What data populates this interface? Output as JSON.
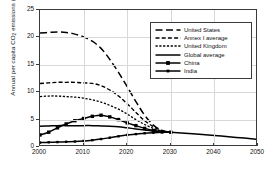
{
  "chart_data": {
    "type": "line",
    "title": "",
    "xlabel": "",
    "ylabel": "Annual per capita CO2 emissions (tCO2)",
    "ylabel_main": "Annual per capita CO",
    "ylabel_sub1": "2",
    "ylabel_mid": " emissions (tCO",
    "ylabel_sub2": "2",
    "ylabel_end": ")",
    "xlim": [
      2000,
      2050
    ],
    "ylim": [
      0,
      25
    ],
    "xticks": [
      "2000",
      "2010",
      "2020",
      "2030",
      "2040",
      "2050"
    ],
    "yticks": [
      "0",
      "5",
      "10",
      "15",
      "20",
      "25"
    ],
    "grid": true,
    "legend_position": "upper right",
    "x": [
      2000,
      2002,
      2004,
      2006,
      2008,
      2010,
      2012,
      2014,
      2016,
      2018,
      2020,
      2022,
      2024,
      2026,
      2028,
      2030,
      2035,
      2040,
      2045,
      2050
    ],
    "series": [
      {
        "name": "United States",
        "style": "long-dash",
        "marker": "none",
        "color": "#000000",
        "values": [
          20.8,
          20.9,
          21.0,
          20.9,
          20.6,
          20.1,
          19.3,
          18.0,
          16.0,
          13.6,
          11.0,
          8.3,
          5.8,
          4.0,
          3.0,
          2.7,
          null,
          null,
          null,
          null
        ]
      },
      {
        "name": "Annex I average",
        "style": "dash",
        "marker": "none",
        "color": "#000000",
        "values": [
          11.6,
          11.7,
          11.8,
          11.8,
          11.8,
          11.7,
          11.6,
          11.2,
          10.4,
          9.3,
          7.9,
          6.3,
          4.8,
          3.7,
          3.0,
          2.7,
          null,
          null,
          null,
          null
        ]
      },
      {
        "name": "United Kingdom",
        "style": "short-dash",
        "marker": "none",
        "color": "#000000",
        "values": [
          9.2,
          9.3,
          9.3,
          9.2,
          9.1,
          8.9,
          8.6,
          8.2,
          7.6,
          6.9,
          6.0,
          5.0,
          4.1,
          3.4,
          2.9,
          2.7,
          null,
          null,
          null,
          null
        ]
      },
      {
        "name": "Global average",
        "style": "solid",
        "marker": "none",
        "color": "#000000",
        "values": [
          3.8,
          3.85,
          3.9,
          3.9,
          3.9,
          3.9,
          3.9,
          3.85,
          3.8,
          3.7,
          3.5,
          3.3,
          3.1,
          2.9,
          2.75,
          2.7,
          2.4,
          2.1,
          1.75,
          1.4
        ]
      },
      {
        "name": "China",
        "style": "solid",
        "marker": "square",
        "color": "#000000",
        "values": [
          2.2,
          2.7,
          3.5,
          4.2,
          4.8,
          5.2,
          5.6,
          5.8,
          5.5,
          5.0,
          4.4,
          3.9,
          3.4,
          3.0,
          2.8,
          2.7,
          null,
          null,
          null,
          null
        ]
      },
      {
        "name": "India",
        "style": "solid",
        "marker": "square-small",
        "color": "#000000",
        "values": [
          0.8,
          0.85,
          0.9,
          0.95,
          1.0,
          1.1,
          1.25,
          1.45,
          1.7,
          1.95,
          2.2,
          2.35,
          2.5,
          2.6,
          2.67,
          2.7,
          null,
          null,
          null,
          null
        ]
      }
    ]
  }
}
